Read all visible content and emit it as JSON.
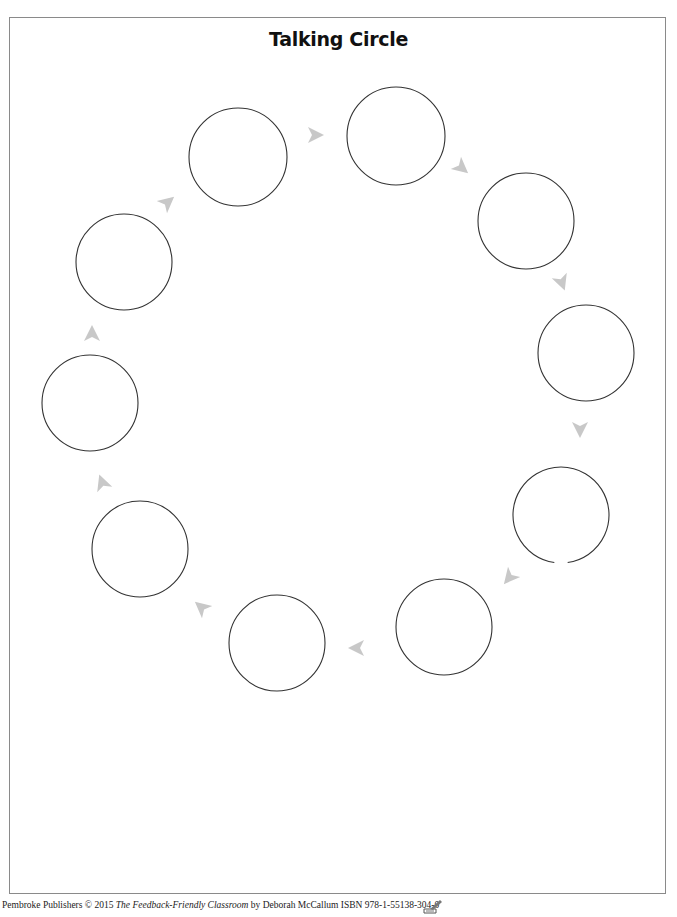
{
  "page": {
    "title": "Talking Circle",
    "border_color": "#8a8a8a"
  },
  "diagram": {
    "circle_stroke": "#333333",
    "arrow_fill": "#c8c8c8",
    "circles": [
      {
        "id": 1,
        "cx": 238,
        "cy": 157,
        "r": 49
      },
      {
        "id": 2,
        "cx": 396,
        "cy": 136,
        "r": 49
      },
      {
        "id": 3,
        "cx": 526,
        "cy": 221,
        "r": 48
      },
      {
        "id": 4,
        "cx": 586,
        "cy": 353,
        "r": 48
      },
      {
        "id": 5,
        "cx": 561,
        "cy": 515,
        "r": 48,
        "gap_at_bottom": true
      },
      {
        "id": 6,
        "cx": 444,
        "cy": 627,
        "r": 48
      },
      {
        "id": 7,
        "cx": 277,
        "cy": 643,
        "r": 48
      },
      {
        "id": 8,
        "cx": 140,
        "cy": 549,
        "r": 48
      },
      {
        "id": 9,
        "cx": 90,
        "cy": 403,
        "r": 48
      },
      {
        "id": 10,
        "cx": 124,
        "cy": 262,
        "r": 48
      }
    ],
    "arrows": [
      {
        "x": 316,
        "y": 135,
        "rot": 0
      },
      {
        "x": 462,
        "y": 168,
        "rot": 40
      },
      {
        "x": 562,
        "y": 283,
        "rot": 70
      },
      {
        "x": 580,
        "y": 430,
        "rot": 90
      },
      {
        "x": 509,
        "y": 578,
        "rot": 130
      },
      {
        "x": 356,
        "y": 648,
        "rot": 180
      },
      {
        "x": 201,
        "y": 607,
        "rot": 220
      },
      {
        "x": 102,
        "y": 482,
        "rot": 250
      },
      {
        "x": 92,
        "y": 333,
        "rot": 270
      },
      {
        "x": 168,
        "y": 202,
        "rot": 320
      }
    ]
  },
  "footer": {
    "prefix": "Pembroke Publishers © 2015 ",
    "book_title": "The Feedback-Friendly Classroom",
    "suffix": " by Deborah McCallum  ISBN 978-1-55138-304-0",
    "icon": "reproducible-page-icon"
  }
}
